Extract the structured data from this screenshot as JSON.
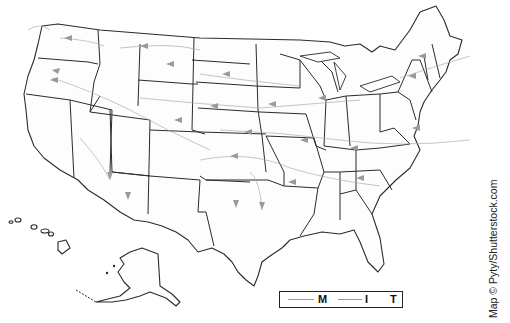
{
  "map": {
    "title": "United States map with prevailing air-mass flow arrows",
    "region": "Contiguous United States, Alaska, Hawaii",
    "colors": {
      "state_fill": "#fdfdfd",
      "border": "#2b2b2b",
      "route": "#a9a9a9",
      "arrow": "#9a9a9a"
    }
  },
  "legend": {
    "items": [
      {
        "label": "M",
        "symbol": "thin-line"
      },
      {
        "label": "I",
        "symbol": "thin-line"
      },
      {
        "label": "T",
        "symbol": "none"
      }
    ]
  },
  "credit": "Map © Pyty/Shutterstock.com"
}
